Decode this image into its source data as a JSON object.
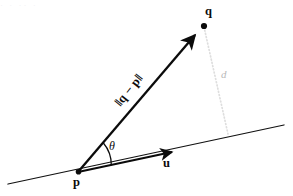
{
  "figure": {
    "type": "vector-geometry-diagram",
    "background_color": "#ffffff",
    "ink_color": "#0b0b0b",
    "faint_color": "#dcdcdc",
    "ghost_color": "#f2f2f4",
    "top_ghost_text": "·   ·    ··     ·",
    "labels": {
      "point_p": "p",
      "point_q": "q",
      "unit_vector": "u",
      "angle": "θ",
      "distance": "d",
      "norm_expression": "‖q − p‖"
    },
    "geometry": {
      "point_p": [
        78,
        172
      ],
      "point_q": [
        204,
        25
      ],
      "baseline_start": [
        8,
        184
      ],
      "baseline_end": [
        284,
        125
      ],
      "u_arrow_tip": [
        177,
        151
      ],
      "q_arrow_tip": [
        199,
        28
      ],
      "perpendicular_foot": [
        228,
        134
      ],
      "angle_arc_radius": 34,
      "angle_degrees": 37
    }
  }
}
